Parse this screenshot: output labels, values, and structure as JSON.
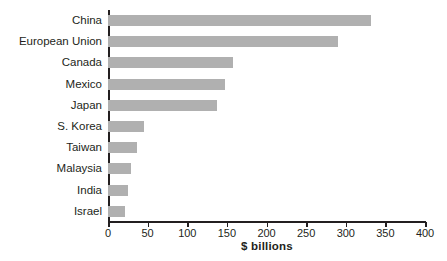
{
  "chart_data": {
    "type": "bar",
    "orientation": "horizontal",
    "title": "",
    "xlabel": "$ billions",
    "ylabel": "",
    "xlim": [
      0,
      400
    ],
    "xticks": [
      0,
      50,
      100,
      150,
      200,
      250,
      300,
      350,
      400
    ],
    "xtick_labels": [
      "0",
      "50",
      "100",
      "150",
      "200",
      "250",
      "300",
      "350",
      "400"
    ],
    "grid": false,
    "legend": null,
    "bar_color": "#b0b0b0",
    "axis_color": "#231f20",
    "categories": [
      "China",
      "European Union",
      "Canada",
      "Mexico",
      "Japan",
      "S. Korea",
      "Taiwan",
      "Malaysia",
      "India",
      "Israel"
    ],
    "values": [
      332,
      290,
      158,
      148,
      137,
      45,
      36,
      29,
      25,
      21
    ],
    "bars": [
      {
        "label": "China",
        "value": 332
      },
      {
        "label": "European Union",
        "value": 290
      },
      {
        "label": "Canada",
        "value": 158
      },
      {
        "label": "Mexico",
        "value": 148
      },
      {
        "label": "Japan",
        "value": 137
      },
      {
        "label": "S. Korea",
        "value": 45
      },
      {
        "label": "Taiwan",
        "value": 36
      },
      {
        "label": "Malaysia",
        "value": 29
      },
      {
        "label": "India",
        "value": 25
      },
      {
        "label": "Israel",
        "value": 21
      }
    ]
  }
}
